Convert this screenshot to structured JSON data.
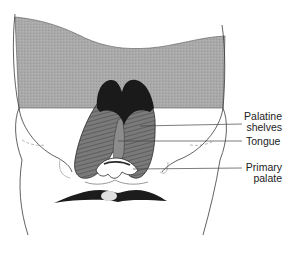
{
  "figure": {
    "colors": {
      "background": "#ffffff",
      "shaded_band": "#a9a9a9",
      "outline": "#3a3a3a",
      "shelf_fill": "#6f6f6f",
      "shelf_dark": "#1a1a1a",
      "mouth": "#1c1c1c",
      "leader_line": "#444444",
      "label_text": "#222222"
    }
  },
  "labels": [
    {
      "id": "palatine-shelves",
      "line1": "Palatine",
      "line2": "shelves"
    },
    {
      "id": "tongue",
      "line1": "Tongue"
    },
    {
      "id": "primary-palate",
      "line1": "Primary",
      "line2": "palate"
    }
  ]
}
